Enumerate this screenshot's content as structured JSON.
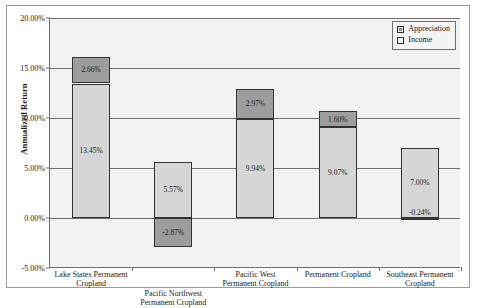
{
  "chart_data": {
    "type": "bar",
    "subtype": "stacked-bar",
    "title": "",
    "xlabel": "",
    "ylabel": "Annualized Return",
    "ylim": [
      -5,
      20
    ],
    "ytick_values": [
      20,
      15,
      10,
      5,
      0,
      -5
    ],
    "ytick_labels": [
      "20.00%",
      "15.00%",
      "10.00%",
      "5.00%",
      "0.00%",
      "-5.00%"
    ],
    "grid": true,
    "legend_position": "top-right",
    "categories": [
      "Lake States Permanent Cropland",
      "Pacific Northwest Permanent Cropland",
      "Pacific West Permanent Cropland",
      "Permanent Cropland",
      "Southeast Permanent Cropland"
    ],
    "category_lines": [
      [
        "Lake States Permanent",
        "Cropland"
      ],
      [
        "Pacific Northwest",
        "Permanent Cropland"
      ],
      [
        "Pacific West",
        "Permanent Cropland"
      ],
      [
        "Permanent Cropland"
      ],
      [
        "Southeast Permanent",
        "Cropland"
      ]
    ],
    "series": [
      {
        "name": "Income",
        "color": "#d6d6d6",
        "values": [
          13.45,
          5.57,
          9.94,
          9.07,
          7.0
        ],
        "labels": [
          "13.45%",
          "5.57%",
          "9.94%",
          "9.07%",
          "7.00%"
        ]
      },
      {
        "name": "Appreciation",
        "color": "#9d9d9d",
        "values": [
          2.66,
          -2.87,
          2.97,
          1.6,
          -0.24
        ],
        "labels": [
          "2.66%",
          "-2.87%",
          "2.97%",
          "1.60%",
          "-0.24%"
        ]
      }
    ],
    "totals": [
      16.11,
      2.7,
      12.91,
      10.67,
      6.76
    ]
  },
  "legend": {
    "items": [
      {
        "label": "Appreciation",
        "swatch": "filled"
      },
      {
        "label": "Income",
        "swatch": "hollow"
      }
    ]
  }
}
